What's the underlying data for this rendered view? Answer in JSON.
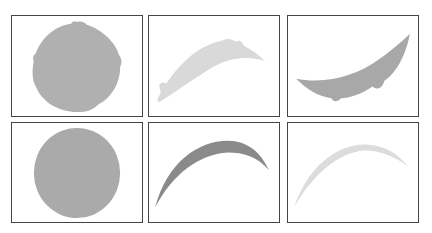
{
  "figure": {
    "layout": {
      "rows": 2,
      "cols": 3
    },
    "panels": [
      {
        "id": "p1",
        "shape": "circle-rough-edges",
        "fill": "#b0b0b0"
      },
      {
        "id": "p2",
        "shape": "crescent-rough-edges",
        "fill": "#d9d9d9"
      },
      {
        "id": "p3",
        "shape": "crescent-bowl-rough-edges",
        "fill": "#a8a8a8"
      },
      {
        "id": "p4",
        "shape": "circle-smooth",
        "fill": "#aaaaaa"
      },
      {
        "id": "p5",
        "shape": "crescent-thin-dark",
        "fill": "#8a8a8a"
      },
      {
        "id": "p6",
        "shape": "crescent-thin-light",
        "fill": "#dcdcdc"
      }
    ]
  }
}
